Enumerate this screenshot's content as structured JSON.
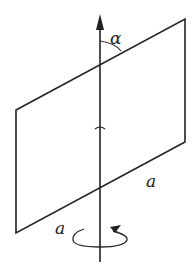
{
  "diagram": {
    "labels": {
      "angle": "α",
      "side_edge": "a",
      "axis_side": "a"
    },
    "colors": {
      "stroke": "#222222",
      "background": "#ffffff"
    }
  }
}
